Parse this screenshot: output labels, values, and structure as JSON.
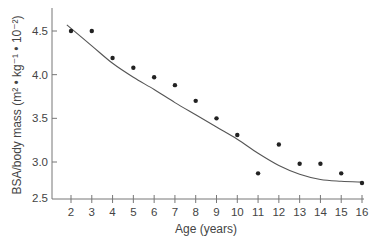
{
  "chart_data": {
    "type": "scatter",
    "title": "",
    "xlabel": "Age (years)",
    "ylabel": "BSA/body mass (m² • kg⁻¹ • 10⁻²)",
    "xlim": [
      1.1,
      16.2
    ],
    "ylim": [
      2.5,
      4.8
    ],
    "x_ticks": [
      2,
      3,
      4,
      5,
      6,
      7,
      8,
      9,
      10,
      11,
      12,
      13,
      14,
      15,
      16
    ],
    "y_ticks": [
      2.5,
      3.0,
      3.5,
      4.0,
      4.5
    ],
    "y_tick_labels": [
      "2.5",
      "3.0",
      "3.5",
      "4.0",
      "4.5"
    ],
    "grid": false,
    "legend": null,
    "series": [
      {
        "name": "observed",
        "style": "points",
        "x": [
          2,
          3,
          4,
          5,
          6,
          7,
          8,
          9,
          10,
          11,
          12,
          13,
          14,
          15,
          16
        ],
        "y": [
          4.5,
          4.5,
          4.19,
          4.08,
          3.97,
          3.88,
          3.7,
          3.5,
          3.31,
          2.87,
          3.2,
          2.98,
          2.98,
          2.87,
          2.76
        ]
      },
      {
        "name": "fitted curve",
        "style": "line",
        "x": [
          1.8,
          3,
          4,
          5,
          6,
          7,
          8,
          9,
          10,
          11,
          12,
          13,
          14,
          15,
          16
        ],
        "y": [
          4.57,
          4.33,
          4.13,
          3.97,
          3.83,
          3.68,
          3.54,
          3.4,
          3.26,
          3.1,
          2.96,
          2.86,
          2.8,
          2.78,
          2.77
        ]
      }
    ]
  },
  "labels": {
    "xlabel": "Age (years)",
    "ylabel": "BSA/body mass (m² • kg⁻¹ • 10⁻²)"
  }
}
